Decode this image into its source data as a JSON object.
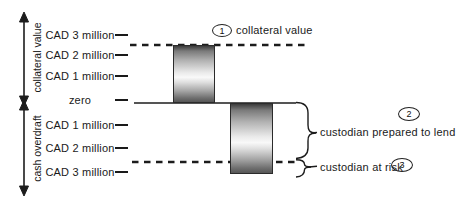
{
  "diagram": {
    "title_hint": "collateral value versus cash overdraft",
    "axis": {
      "collateral_axis_label": "collateral value",
      "overdraft_axis_label": "cash overdraft"
    },
    "ticks": [
      {
        "text": "CAD 3 million"
      },
      {
        "text": "CAD 2 million"
      },
      {
        "text": "CAD 1 million"
      },
      {
        "text": "zero"
      },
      {
        "text": "CAD 1 million"
      },
      {
        "text": "CAD 2 million"
      },
      {
        "text": "CAD 3 million"
      }
    ],
    "callouts": [
      {
        "number": "1",
        "label": "collateral value"
      },
      {
        "number": "2",
        "label": "custodian prepared to lend"
      },
      {
        "number": "3",
        "label": "custodian at risk"
      }
    ],
    "bars": [
      {
        "name": "collateral bar",
        "from": "zero",
        "to": "collateral value line (~CAD 2.5 million)"
      },
      {
        "name": "overdraft bar",
        "from": "zero",
        "to": "~CAD 3 million overdraft"
      }
    ],
    "colors": {
      "line": "#1c1c1c",
      "background": "#ffffff"
    }
  }
}
